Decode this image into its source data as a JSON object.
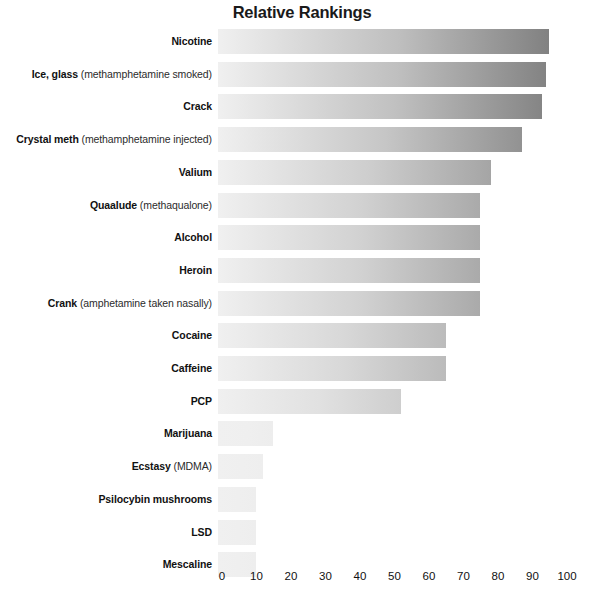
{
  "chart_data": {
    "type": "bar",
    "orientation": "horizontal",
    "title": "Relative Rankings",
    "xlabel": "",
    "ylabel": "",
    "xlim": [
      0,
      100
    ],
    "grid": false,
    "legend": null,
    "ticks": [
      0,
      10,
      20,
      30,
      40,
      50,
      60,
      70,
      80,
      90,
      100
    ],
    "categories": [
      "Nicotine",
      "Ice, glass (methamphetamine smoked)",
      "Crack",
      "Crystal meth (methamphetamine injected)",
      "Valium",
      "Quaalude (methaqualone)",
      "Alcohol",
      "Heroin",
      "Crank (amphetamine taken nasally)",
      "Cocaine",
      "Caffeine",
      "PCP",
      "Marijuana",
      "Ecstasy (MDMA)",
      "Psilocybin mushrooms",
      "LSD",
      "Mescaline"
    ],
    "values": [
      96,
      95,
      94,
      88,
      79,
      76,
      76,
      76,
      76,
      66,
      66,
      53,
      16,
      13,
      11,
      11,
      11
    ],
    "bars": [
      {
        "name": "Nicotine",
        "qualifier": "",
        "value": 96
      },
      {
        "name": "Ice, glass",
        "qualifier": "(methamphetamine smoked)",
        "value": 95
      },
      {
        "name": "Crack",
        "qualifier": "",
        "value": 94
      },
      {
        "name": "Crystal meth",
        "qualifier": "(methamphetamine injected)",
        "value": 88
      },
      {
        "name": "Valium",
        "qualifier": "",
        "value": 79
      },
      {
        "name": "Quaalude",
        "qualifier": "(methaqualone)",
        "value": 76
      },
      {
        "name": "Alcohol",
        "qualifier": "",
        "value": 76
      },
      {
        "name": "Heroin",
        "qualifier": "",
        "value": 76
      },
      {
        "name": "Crank",
        "qualifier": "(amphetamine taken nasally)",
        "value": 76
      },
      {
        "name": "Cocaine",
        "qualifier": "",
        "value": 66
      },
      {
        "name": "Caffeine",
        "qualifier": "",
        "value": 66
      },
      {
        "name": "PCP",
        "qualifier": "",
        "value": 53
      },
      {
        "name": "Marijuana",
        "qualifier": "",
        "value": 16
      },
      {
        "name": "Ecstasy",
        "qualifier": "(MDMA)",
        "value": 13
      },
      {
        "name": "Psilocybin mushrooms",
        "qualifier": "",
        "value": 11
      },
      {
        "name": "LSD",
        "qualifier": "",
        "value": 11
      },
      {
        "name": "Mescaline",
        "qualifier": "",
        "value": 11
      }
    ],
    "colors": {
      "bar_gradient_start": "#f0f0f0",
      "bar_gradient_end_max": "#7d7d7d",
      "text": "#111111",
      "background": "#ffffff"
    }
  }
}
